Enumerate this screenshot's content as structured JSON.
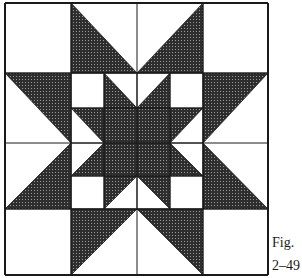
{
  "figure": {
    "caption_line1": "Fig.",
    "caption_line2": "2–49"
  },
  "colors": {
    "dark_fill": "#3a3a3a",
    "line": "#1a1a1a",
    "background": "#ffffff"
  },
  "grid": {
    "outer_x": [
      5,
      71,
      137,
      203,
      268
    ],
    "outer_y": [
      3,
      73,
      143,
      209,
      275
    ],
    "inner_x": [
      71,
      104,
      137,
      170,
      203
    ],
    "inner_y": [
      73,
      108,
      143,
      176,
      209
    ]
  },
  "dark_shapes": [
    {
      "name": "outer-top-left-point",
      "points": "71,3 71,73 137,73"
    },
    {
      "name": "outer-top-right-point",
      "points": "203,3 137,73 203,73"
    },
    {
      "name": "outer-left-top-point",
      "points": "5,73 71,73 71,143"
    },
    {
      "name": "outer-left-bottom-point",
      "points": "71,143 71,209 5,209"
    },
    {
      "name": "outer-bottom-left-point",
      "points": "71,209 137,209 71,275"
    },
    {
      "name": "outer-bottom-right-point",
      "points": "137,209 203,209 203,275"
    },
    {
      "name": "outer-right-top-point",
      "points": "203,73 268,73 203,143"
    },
    {
      "name": "outer-right-bottom-point",
      "points": "203,143 203,209 268,209"
    },
    {
      "name": "inner-top-left-point",
      "points": "104,73 104,108 137,108"
    },
    {
      "name": "inner-top-right-point",
      "points": "170,73 170,108 137,108"
    },
    {
      "name": "inner-left-top-point",
      "points": "71,108 104,108 104,143"
    },
    {
      "name": "inner-right-top-point",
      "points": "170,108 203,108 170,143"
    },
    {
      "name": "inner-left-bottom-point",
      "points": "104,143 104,176 71,176"
    },
    {
      "name": "inner-right-bottom-point",
      "points": "170,143 170,176 203,176"
    },
    {
      "name": "inner-bottom-left-point",
      "points": "104,176 137,176 104,209"
    },
    {
      "name": "inner-bottom-right-point",
      "points": "137,176 170,176 170,209"
    },
    {
      "name": "center-square",
      "points": "104,108 170,108 170,176 104,176"
    }
  ]
}
